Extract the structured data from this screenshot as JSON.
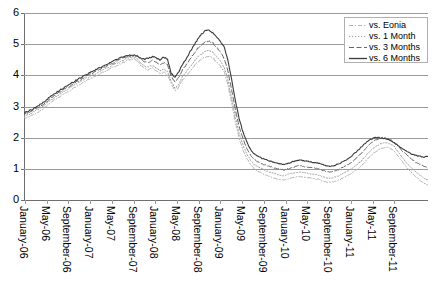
{
  "chart_data": {
    "type": "line",
    "title": "",
    "subtitle": "",
    "xlabel": "",
    "ylabel": "",
    "ylim": [
      0,
      6
    ],
    "yticks": [
      0,
      1,
      2,
      3,
      4,
      5,
      6
    ],
    "grid": true,
    "legend_position": "top-right",
    "x_tick_labels": [
      "January-06",
      "May-06",
      "September-06",
      "January-07",
      "May-07",
      "September-07",
      "January-08",
      "May-08",
      "September-08",
      "January-09",
      "May-09",
      "September-09",
      "January-10",
      "May-10",
      "September-10",
      "January-11",
      "May-11",
      "September-11"
    ],
    "x_start": "January-06",
    "x_end": "December-11",
    "series": [
      {
        "name": "vs. Eonia",
        "style": "dash-dot",
        "color": "#b3b3b3",
        "values": [
          2.62,
          2.66,
          2.71,
          2.78,
          2.84,
          2.92,
          3.02,
          3.12,
          3.2,
          3.28,
          3.36,
          3.44,
          3.5,
          3.58,
          3.66,
          3.72,
          3.8,
          3.86,
          3.92,
          3.98,
          4.04,
          4.1,
          4.16,
          4.22,
          4.28,
          4.34,
          4.4,
          4.46,
          4.5,
          4.54,
          4.46,
          4.3,
          4.22,
          4.18,
          4.24,
          4.16,
          4.06,
          4.1,
          4.02,
          3.72,
          3.5,
          3.62,
          3.86,
          4.0,
          4.14,
          4.3,
          4.42,
          4.52,
          4.58,
          4.62,
          4.56,
          4.42,
          4.3,
          4.12,
          3.7,
          3.1,
          2.5,
          1.98,
          1.6,
          1.34,
          1.14,
          1.0,
          0.92,
          0.86,
          0.8,
          0.76,
          0.72,
          0.68,
          0.66,
          0.64,
          0.68,
          0.72,
          0.74,
          0.76,
          0.74,
          0.72,
          0.7,
          0.68,
          0.66,
          0.62,
          0.58,
          0.56,
          0.58,
          0.62,
          0.68,
          0.74,
          0.8,
          0.88,
          0.96,
          1.06,
          1.18,
          1.32,
          1.44,
          1.54,
          1.62,
          1.66,
          1.7,
          1.66,
          1.58,
          1.42,
          1.26,
          1.1,
          0.96,
          0.84,
          0.72,
          0.62,
          0.54,
          0.48
        ]
      },
      {
        "name": "vs. 1 Month",
        "style": "dotted",
        "color": "#a0a0a0",
        "values": [
          2.7,
          2.74,
          2.79,
          2.86,
          2.92,
          3.0,
          3.1,
          3.2,
          3.28,
          3.36,
          3.44,
          3.52,
          3.58,
          3.66,
          3.74,
          3.8,
          3.88,
          3.94,
          4.0,
          4.06,
          4.12,
          4.18,
          4.24,
          4.3,
          4.36,
          4.42,
          4.48,
          4.52,
          4.56,
          4.6,
          4.52,
          4.38,
          4.3,
          4.26,
          4.32,
          4.24,
          4.14,
          4.2,
          4.12,
          3.8,
          3.58,
          3.72,
          3.96,
          4.12,
          4.28,
          4.44,
          4.58,
          4.68,
          4.76,
          4.8,
          4.74,
          4.6,
          4.46,
          4.26,
          3.86,
          3.26,
          2.66,
          2.14,
          1.76,
          1.48,
          1.28,
          1.14,
          1.06,
          1.0,
          0.94,
          0.9,
          0.86,
          0.82,
          0.8,
          0.78,
          0.82,
          0.86,
          0.88,
          0.9,
          0.88,
          0.86,
          0.84,
          0.82,
          0.8,
          0.76,
          0.72,
          0.7,
          0.72,
          0.76,
          0.82,
          0.88,
          0.94,
          1.02,
          1.12,
          1.22,
          1.34,
          1.48,
          1.6,
          1.7,
          1.78,
          1.82,
          1.84,
          1.8,
          1.72,
          1.56,
          1.4,
          1.24,
          1.1,
          0.98,
          0.88,
          0.78,
          0.7,
          0.64
        ]
      },
      {
        "name": "vs. 3 Months",
        "style": "dashed",
        "color": "#666666",
        "values": [
          2.76,
          2.8,
          2.85,
          2.92,
          2.98,
          3.06,
          3.16,
          3.26,
          3.34,
          3.42,
          3.5,
          3.58,
          3.64,
          3.72,
          3.8,
          3.86,
          3.94,
          4.0,
          4.06,
          4.12,
          4.18,
          4.24,
          4.3,
          4.36,
          4.42,
          4.48,
          4.54,
          4.58,
          4.62,
          4.64,
          4.6,
          4.5,
          4.44,
          4.42,
          4.48,
          4.42,
          4.34,
          4.4,
          4.34,
          3.96,
          3.78,
          3.92,
          4.18,
          4.34,
          4.52,
          4.7,
          4.86,
          4.98,
          5.06,
          5.1,
          5.04,
          4.9,
          4.76,
          4.54,
          4.14,
          3.52,
          2.9,
          2.36,
          1.96,
          1.66,
          1.44,
          1.3,
          1.22,
          1.16,
          1.12,
          1.08,
          1.04,
          1.0,
          0.98,
          0.96,
          1.0,
          1.04,
          1.08,
          1.1,
          1.08,
          1.06,
          1.04,
          1.02,
          1.0,
          0.96,
          0.92,
          0.9,
          0.92,
          0.96,
          1.02,
          1.08,
          1.14,
          1.24,
          1.34,
          1.46,
          1.58,
          1.72,
          1.84,
          1.92,
          1.96,
          1.98,
          1.98,
          1.94,
          1.86,
          1.74,
          1.6,
          1.48,
          1.38,
          1.28,
          1.2,
          1.14,
          1.08,
          1.04
        ]
      },
      {
        "name": "vs. 6 Months",
        "style": "solid",
        "color": "#3a3a3a",
        "values": [
          2.8,
          2.84,
          2.9,
          2.97,
          3.04,
          3.12,
          3.22,
          3.32,
          3.4,
          3.48,
          3.56,
          3.64,
          3.7,
          3.78,
          3.86,
          3.92,
          4.0,
          4.06,
          4.12,
          4.18,
          4.24,
          4.3,
          4.36,
          4.42,
          4.48,
          4.54,
          4.58,
          4.62,
          4.64,
          4.66,
          4.62,
          4.56,
          4.52,
          4.54,
          4.6,
          4.56,
          4.5,
          4.58,
          4.52,
          4.06,
          3.94,
          4.1,
          4.36,
          4.54,
          4.76,
          4.96,
          5.16,
          5.32,
          5.42,
          5.44,
          5.36,
          5.22,
          5.1,
          4.92,
          4.5,
          3.86,
          3.18,
          2.6,
          2.18,
          1.86,
          1.62,
          1.48,
          1.4,
          1.34,
          1.3,
          1.26,
          1.22,
          1.18,
          1.16,
          1.14,
          1.18,
          1.22,
          1.26,
          1.28,
          1.26,
          1.24,
          1.22,
          1.2,
          1.18,
          1.14,
          1.1,
          1.08,
          1.1,
          1.14,
          1.2,
          1.26,
          1.34,
          1.44,
          1.54,
          1.66,
          1.78,
          1.88,
          1.96,
          2.0,
          2.0,
          1.98,
          1.96,
          1.92,
          1.84,
          1.76,
          1.66,
          1.58,
          1.52,
          1.46,
          1.42,
          1.4,
          1.38,
          1.4
        ]
      }
    ]
  },
  "legend": {
    "items": [
      {
        "label": "vs. Eonia"
      },
      {
        "label": "vs. 1 Month"
      },
      {
        "label": "vs. 3 Months"
      },
      {
        "label": "vs. 6 Months"
      }
    ]
  },
  "axes": {
    "y_labels": [
      "6",
      "5",
      "4",
      "3",
      "2",
      "1",
      "0"
    ]
  }
}
